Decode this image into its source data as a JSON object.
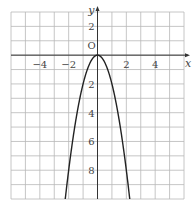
{
  "chart_data": {
    "type": "line",
    "title": "",
    "function": "y = -2x^2",
    "xlabel": "x",
    "ylabel": "y",
    "origin_label": "O",
    "xlim": [
      -6,
      6
    ],
    "ylim": [
      -10,
      3
    ],
    "grid": true,
    "x_ticks": [
      {
        "value": -4,
        "label": "−4"
      },
      {
        "value": -2,
        "label": "−2"
      },
      {
        "value": 2,
        "label": "2"
      },
      {
        "value": 4,
        "label": "4"
      }
    ],
    "y_ticks": [
      {
        "value": 2,
        "label": "2"
      },
      {
        "value": -2,
        "label": "2"
      },
      {
        "value": -4,
        "label": "4"
      },
      {
        "value": -6,
        "label": "6"
      },
      {
        "value": -8,
        "label": "8"
      }
    ],
    "series": [
      {
        "name": "parabola",
        "x": [
          -2.24,
          -2,
          -1.5,
          -1,
          -0.5,
          0,
          0.5,
          1,
          1.5,
          2,
          2.24
        ],
        "y": [
          -10,
          -8,
          -4.5,
          -2,
          -0.5,
          0,
          -0.5,
          -2,
          -4.5,
          -8,
          -10
        ]
      }
    ],
    "colors": {
      "grid": "#b8b8b8",
      "axis": "#333333",
      "curve": "#222222"
    }
  }
}
